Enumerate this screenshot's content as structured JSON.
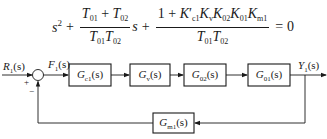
{
  "equation": {
    "term1": "s",
    "term1_power": "2",
    "plus1": "+",
    "frac1": {
      "num_a": "T",
      "num_a_sub": "01",
      "num_op": " + ",
      "num_b": "T",
      "num_b_sub": "02",
      "den_a": "T",
      "den_a_sub": "01",
      "den_b": "T",
      "den_b_sub": "02"
    },
    "s_after": "s",
    "plus2": "+",
    "frac2": {
      "num_one": "1 + ",
      "k1": "K",
      "k1_prime": "′",
      "k1_sub": "c1",
      "k2": "K",
      "k2_sub": "v",
      "k3": "K",
      "k3_sub": "02",
      "k4": "K",
      "k4_sub": "01",
      "k5": "K",
      "k5_sub": "m1",
      "den_a": "T",
      "den_a_sub": "01",
      "den_b": "T",
      "den_b_sub": "02"
    },
    "equals": "=",
    "rhs": "0"
  },
  "diagram": {
    "input": {
      "sym": "R",
      "sub": "1",
      "arg": "(s)"
    },
    "error": {
      "sym": "F",
      "sub": "1",
      "arg": "(s)"
    },
    "output": {
      "sym": "Y",
      "sub": "1",
      "arg": "(s)"
    },
    "plus_sign": "+",
    "minus_sign": "−",
    "blocks": [
      {
        "sym": "G",
        "sub": "c1",
        "arg": "(s)"
      },
      {
        "sym": "G",
        "sub": "v",
        "arg": "(s)"
      },
      {
        "sym": "G",
        "sub": "02",
        "arg": "(s)"
      },
      {
        "sym": "G",
        "sub": "01",
        "arg": "(s)"
      }
    ],
    "feedback_block": {
      "sym": "G",
      "sub": "m1",
      "arg": "(s)"
    }
  },
  "colors": {
    "line": "#1a1a1a",
    "background": "#ffffff"
  }
}
